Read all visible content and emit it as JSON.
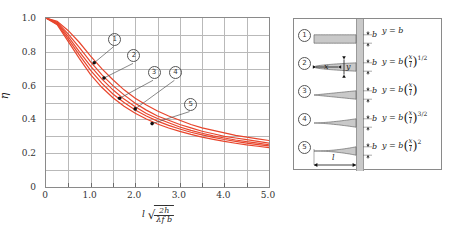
{
  "chart_data": {
    "type": "line",
    "title": "",
    "xlabel": "l sqrt(2h/(lambda_f b))",
    "ylabel": "eta",
    "xlim": [
      0,
      5.0
    ],
    "ylim": [
      0,
      1.0
    ],
    "grid": true,
    "legend_position": "right-panel",
    "x_ticks": [
      "0",
      "1.0",
      "2.0",
      "3.0",
      "4.0",
      "5.0"
    ],
    "x_tick_values": [
      0,
      1.0,
      2.0,
      3.0,
      4.0,
      5.0
    ],
    "y_ticks": [
      "0",
      "0.2",
      "0.4",
      "0.6",
      "0.8",
      "1.0"
    ],
    "y_tick_values": [
      0,
      0.2,
      0.4,
      0.6,
      0.8,
      1.0
    ],
    "x": [
      0,
      0.25,
      0.5,
      0.75,
      1.0,
      1.25,
      1.5,
      1.75,
      2.0,
      2.25,
      2.5,
      2.75,
      3.0,
      3.25,
      3.5,
      3.75,
      4.0,
      4.25,
      4.5,
      4.75,
      5.0
    ],
    "series": [
      {
        "name": "1",
        "label": "①",
        "values": [
          1.0,
          0.98,
          0.925,
          0.855,
          0.775,
          0.7,
          0.635,
          0.575,
          0.525,
          0.485,
          0.45,
          0.42,
          0.395,
          0.37,
          0.35,
          0.335,
          0.32,
          0.305,
          0.295,
          0.285,
          0.275
        ]
      },
      {
        "name": "2",
        "label": "②",
        "values": [
          1.0,
          0.975,
          0.905,
          0.825,
          0.74,
          0.665,
          0.6,
          0.545,
          0.495,
          0.455,
          0.42,
          0.395,
          0.37,
          0.35,
          0.33,
          0.315,
          0.3,
          0.29,
          0.28,
          0.27,
          0.26
        ]
      },
      {
        "name": "3",
        "label": "③",
        "values": [
          1.0,
          0.97,
          0.89,
          0.8,
          0.715,
          0.64,
          0.575,
          0.52,
          0.475,
          0.435,
          0.405,
          0.38,
          0.355,
          0.335,
          0.318,
          0.303,
          0.29,
          0.278,
          0.268,
          0.26,
          0.25
        ]
      },
      {
        "name": "4",
        "label": "④",
        "values": [
          1.0,
          0.965,
          0.875,
          0.78,
          0.69,
          0.615,
          0.55,
          0.5,
          0.455,
          0.42,
          0.39,
          0.365,
          0.343,
          0.324,
          0.308,
          0.294,
          0.281,
          0.27,
          0.26,
          0.251,
          0.243
        ]
      },
      {
        "name": "5",
        "label": "⑤",
        "values": [
          1.0,
          0.96,
          0.86,
          0.76,
          0.665,
          0.59,
          0.528,
          0.478,
          0.436,
          0.402,
          0.373,
          0.349,
          0.329,
          0.311,
          0.295,
          0.282,
          0.27,
          0.259,
          0.249,
          0.241,
          0.233
        ]
      }
    ],
    "series_color": "#e8452c",
    "annotations": [
      {
        "label": "①",
        "text_x": 1.52,
        "text_y": 0.855,
        "point_x": 1.08,
        "point_y": 0.735
      },
      {
        "label": "②",
        "text_x": 1.95,
        "text_y": 0.755,
        "point_x": 1.3,
        "point_y": 0.645
      },
      {
        "label": "③",
        "text_x": 2.4,
        "text_y": 0.655,
        "point_x": 1.65,
        "point_y": 0.525
      },
      {
        "label": "④",
        "text_x": 2.88,
        "text_y": 0.655,
        "point_x": 2.0,
        "point_y": 0.462
      },
      {
        "label": "⑤",
        "text_x": 3.22,
        "text_y": 0.47,
        "point_x": 2.38,
        "point_y": 0.375
      }
    ]
  },
  "axes": {
    "y_title": "η",
    "x_title_leading": "l",
    "x_title_numerator": "2h̄",
    "x_title_denominator": "λf b"
  },
  "legend_panel": {
    "wall_label": "",
    "length_label": "l",
    "x_label": "x",
    "y_label": "y",
    "thickness_label": "b",
    "rows": [
      {
        "index": "①",
        "profile": "rectangular",
        "eq_lhs": "y =",
        "eq_coef": "b",
        "eq_has_paren": false,
        "eq_num": "",
        "eq_den": "",
        "eq_exp": ""
      },
      {
        "index": "②",
        "profile": "power-half",
        "eq_lhs": "y =",
        "eq_coef": "b",
        "eq_has_paren": true,
        "eq_num": "x",
        "eq_den": "l",
        "eq_exp": "1/2"
      },
      {
        "index": "③",
        "profile": "triangular",
        "eq_lhs": "y =",
        "eq_coef": "b",
        "eq_has_paren": true,
        "eq_num": "x",
        "eq_den": "l",
        "eq_exp": ""
      },
      {
        "index": "④",
        "profile": "power-three-halves",
        "eq_lhs": "y =",
        "eq_coef": "b",
        "eq_has_paren": true,
        "eq_num": "x",
        "eq_den": "l",
        "eq_exp": "3/2"
      },
      {
        "index": "⑤",
        "profile": "parabolic",
        "eq_lhs": "y =",
        "eq_coef": "b",
        "eq_has_paren": true,
        "eq_num": "x",
        "eq_den": "l",
        "eq_exp": "2"
      }
    ]
  },
  "colors": {
    "curve": "#e8452c",
    "grid": "#b9b9b9",
    "frame": "#8a8a8a",
    "fin_fill": "#c9c9c9",
    "wall": "#c9c9c9"
  }
}
